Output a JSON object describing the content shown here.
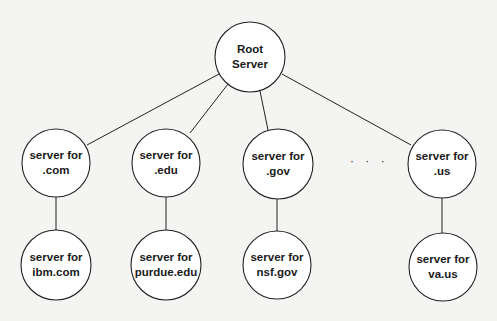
{
  "diagram": {
    "type": "tree",
    "colors": {
      "background": "#f4f4f2",
      "stroke": "#222222",
      "node_fill": "#ffffff",
      "text": "#1a1a1a"
    },
    "root": {
      "id": "root",
      "line1": "Root",
      "line2": "Server",
      "cx": 250,
      "cy": 57,
      "r": 35
    },
    "level1": [
      {
        "id": "com",
        "line1": "server for",
        "line2": ".com",
        "cx": 56,
        "cy": 163,
        "r": 34
      },
      {
        "id": "edu",
        "line1": "server for",
        "line2": ".edu",
        "cx": 166,
        "cy": 163,
        "r": 34
      },
      {
        "id": "gov",
        "line1": "server for",
        "line2": ".gov",
        "cx": 278,
        "cy": 164,
        "r": 35
      },
      {
        "id": "us",
        "line1": "server for",
        "line2": ".us",
        "cx": 442,
        "cy": 164,
        "r": 34
      }
    ],
    "ellipsis": "· · ·",
    "level2": [
      {
        "id": "ibm",
        "parent": "com",
        "line1": "server for",
        "line2": "ibm.com",
        "cx": 56,
        "cy": 265,
        "r": 35
      },
      {
        "id": "purdue",
        "parent": "edu",
        "line1": "server for",
        "line2": "purdue.edu",
        "cx": 166,
        "cy": 265,
        "r": 35
      },
      {
        "id": "nsf",
        "parent": "gov",
        "line1": "server for",
        "line2": "nsf.gov",
        "cx": 277,
        "cy": 265,
        "r": 34
      },
      {
        "id": "va",
        "parent": "us",
        "line1": "server for",
        "line2": "va.us",
        "cx": 443,
        "cy": 267,
        "r": 34
      }
    ]
  }
}
